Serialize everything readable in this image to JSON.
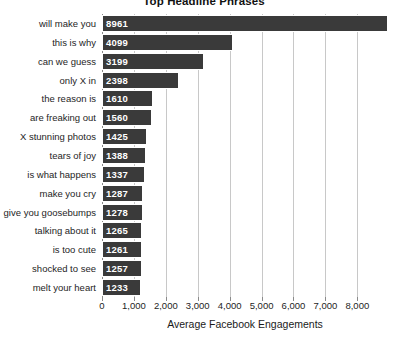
{
  "chart_data": {
    "type": "bar",
    "orientation": "horizontal",
    "title": "Top Headline Phrases",
    "xlabel": "Average Facebook Engagements",
    "ylabel": "",
    "categories": [
      "will make you",
      "this is why",
      "can we guess",
      "only X in",
      "the reason is",
      "are freaking out",
      "X stunning photos",
      "tears of joy",
      "is what happens",
      "make you cry",
      "give you goosebumps",
      "talking about it",
      "is too cute",
      "shocked to see",
      "melt your heart"
    ],
    "values": [
      8961,
      4099,
      3199,
      2398,
      1610,
      1560,
      1425,
      1388,
      1337,
      1287,
      1278,
      1265,
      1261,
      1257,
      1233
    ],
    "value_labels": [
      "8961",
      "4099",
      "3199",
      "2398",
      "1610",
      "1560",
      "1425",
      "1388",
      "1337",
      "1287",
      "1278",
      "1265",
      "1261",
      "1257",
      "1233"
    ],
    "xticks": [
      0,
      1000,
      2000,
      3000,
      4000,
      5000,
      6000,
      7000,
      8000
    ],
    "xtick_labels": [
      "0",
      "1,000",
      "2,000",
      "3,000",
      "4,000",
      "5,000",
      "6,000",
      "7,000",
      "8,000"
    ],
    "xlim": [
      0,
      8961
    ],
    "grid": true,
    "legend": false,
    "bar_color": "#3a3a3a",
    "grid_color": "#c8c8c8",
    "background_color": "#ffffff"
  }
}
